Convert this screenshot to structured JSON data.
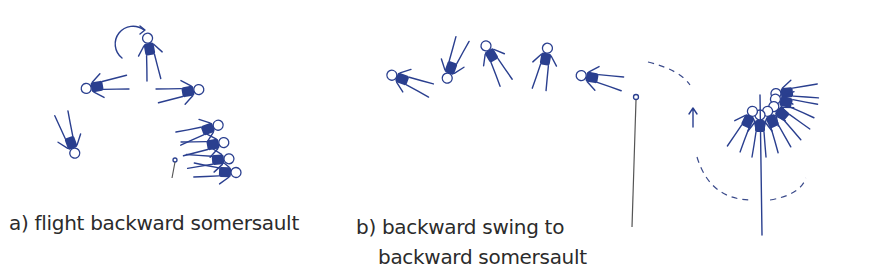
{
  "figure": {
    "panels": [
      {
        "id": "a",
        "caption_line1": "a) flight backward somersault",
        "caption_line2": ""
      },
      {
        "id": "b",
        "caption_line1": "b) backward swing to",
        "caption_line2": "backward somersault"
      }
    ],
    "colors": {
      "figure_fill": "#2a3f8f",
      "caption_text": "#2b2b2b",
      "background": "#ffffff"
    }
  }
}
